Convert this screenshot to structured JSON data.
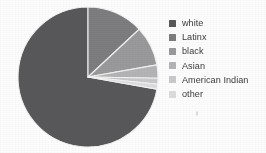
{
  "figure": {
    "background_color": "#fdfdfd",
    "speck_color": "#d8d8da"
  },
  "chart_data": {
    "type": "pie",
    "title": "",
    "subtitle": "",
    "xlabel": "",
    "ylabel": "",
    "grid": false,
    "legend_position": "right",
    "start_angle_deg": 0,
    "direction": "clockwise",
    "center": {
      "x": 88,
      "y": 77
    },
    "radius": 70,
    "categories": [
      "white",
      "Latinx",
      "black",
      "Asian",
      "American Indian",
      "other"
    ],
    "values": [
      72,
      13,
      9,
      3,
      1.5,
      1.5
    ],
    "colors": [
      "#58585a",
      "#7d7d7f",
      "#9a9a9c",
      "#b4b4b6",
      "#c9c9cb",
      "#dcdcde"
    ],
    "slices": [
      {
        "label": "white",
        "value": 72,
        "color": "#58585a",
        "start_deg": 100,
        "end_deg": 360
      },
      {
        "label": "Latinx",
        "value": 13,
        "color": "#7d7d7f",
        "start_deg": 0,
        "end_deg": 47
      },
      {
        "label": "black",
        "value": 9,
        "color": "#9a9a9c",
        "start_deg": 47,
        "end_deg": 80
      },
      {
        "label": "Asian",
        "value": 3,
        "color": "#b4b4b6",
        "start_deg": 80,
        "end_deg": 91
      },
      {
        "label": "American Indian",
        "value": 1.5,
        "color": "#c9c9cb",
        "start_deg": 91,
        "end_deg": 96
      },
      {
        "label": "other",
        "value": 1.5,
        "color": "#dcdcde",
        "start_deg": 96,
        "end_deg": 100
      }
    ],
    "wedge_edge_color": "#f2f2f2"
  },
  "legend": {
    "items": [
      {
        "label": "white",
        "color": "#58585a"
      },
      {
        "label": "Latinx",
        "color": "#7d7d7f"
      },
      {
        "label": "black",
        "color": "#9a9a9c"
      },
      {
        "label": "Asian",
        "color": "#b4b4b6"
      },
      {
        "label": "American Indian",
        "color": "#c9c9cb"
      },
      {
        "label": "other",
        "color": "#dcdcde"
      }
    ]
  }
}
